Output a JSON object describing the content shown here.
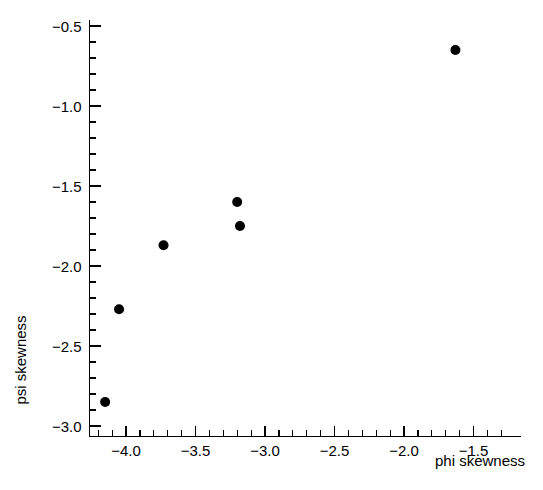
{
  "chart_data": {
    "type": "scatter",
    "title": "",
    "xlabel": "phi skewness",
    "ylabel": "psi skewness",
    "xlim": [
      -4.28,
      -1.32
    ],
    "ylim": [
      -3.05,
      -0.41
    ],
    "grid": false,
    "legend": null,
    "xticks": [
      "-4.0",
      "-3.5",
      "-3.0",
      "-2.5",
      "-2.0",
      "-1.5"
    ],
    "xtick_values": [
      -4.0,
      -3.5,
      -3.0,
      -2.5,
      -2.0,
      -1.5
    ],
    "yticks": [
      "-0.5",
      "-1.0",
      "-1.5",
      "-2.0",
      "-2.5",
      "-3.0"
    ],
    "ytick_values": [
      -0.5,
      -1.0,
      -1.5,
      -2.0,
      -2.5,
      -3.0
    ],
    "minor_tick_step_x": 0.1,
    "minor_tick_step_y": 0.1,
    "marker": "filled-circle",
    "marker_color": "#000000",
    "marker_size": 5,
    "points": [
      {
        "x": -4.15,
        "y": -2.85
      },
      {
        "x": -4.05,
        "y": -2.27
      },
      {
        "x": -3.73,
        "y": -1.87
      },
      {
        "x": -3.2,
        "y": -1.6
      },
      {
        "x": -3.18,
        "y": -1.75
      },
      {
        "x": -1.63,
        "y": -0.65
      }
    ],
    "x": [
      -4.15,
      -4.05,
      -3.73,
      -3.2,
      -3.18,
      -1.63
    ],
    "y": [
      -2.85,
      -2.27,
      -1.87,
      -1.6,
      -1.75,
      -0.65
    ]
  },
  "axes": {
    "x_axis_title": "phi skewness",
    "y_axis_title": "psi skewness"
  }
}
